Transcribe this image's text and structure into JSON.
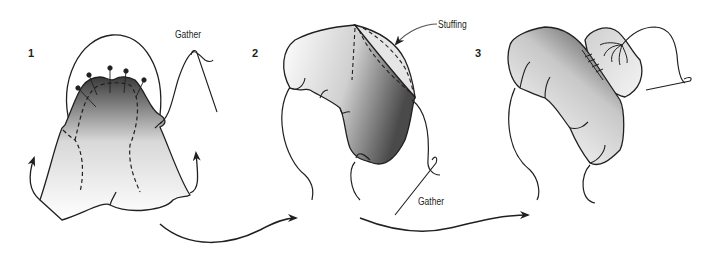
{
  "diagram": {
    "type": "instructional-illustration",
    "steps": [
      {
        "number": "1",
        "labels": [
          "Gather"
        ]
      },
      {
        "number": "2",
        "labels": [
          "Stuffing",
          "Gather"
        ]
      },
      {
        "number": "3",
        "labels": []
      }
    ],
    "labels": {
      "step1_number": "1",
      "step2_number": "2",
      "step3_number": "3",
      "gather_top": "Gather",
      "stuffing": "Stuffing",
      "gather_bottom": "Gather"
    },
    "colors": {
      "line": "#231f20",
      "shade_dark": "#555555",
      "shade_light": "#ffffff",
      "background": "#ffffff"
    }
  }
}
